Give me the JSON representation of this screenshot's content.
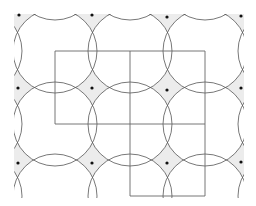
{
  "diagram": {
    "type": "circle-covering-lattice",
    "width": 256,
    "height": 206,
    "colors": {
      "background": "#ffffff",
      "uncovered_fill": "#ececec",
      "double_overlap_fill": "#dcdcdc",
      "quad_overlap_fill": "#b8b8b8",
      "stroke": "#555555",
      "grid_line": "#666666",
      "dot": "#111111"
    },
    "vertices_x": [
      55,
      130,
      205
    ],
    "vertices_y": [
      51,
      124,
      196
    ],
    "extra_circle_columns": [
      -20,
      280
    ],
    "extra_circle_rows": [
      -22
    ],
    "circle_radius": 42,
    "dots": [
      [
        19,
        15
      ],
      [
        92,
        15
      ],
      [
        167,
        17
      ],
      [
        241,
        16
      ],
      [
        18,
        88
      ],
      [
        92,
        88
      ],
      [
        167,
        90
      ],
      [
        241,
        88
      ],
      [
        18,
        163
      ],
      [
        92,
        163
      ],
      [
        167,
        163
      ],
      [
        241,
        162
      ]
    ],
    "dot_radius": 1.6,
    "grid_segments": [
      [
        55,
        51,
        205,
        51
      ],
      [
        55,
        124,
        205,
        124
      ],
      [
        130,
        196,
        205,
        196
      ],
      [
        55,
        51,
        55,
        124
      ],
      [
        130,
        51,
        130,
        196
      ],
      [
        205,
        51,
        205,
        196
      ]
    ],
    "clip": {
      "x": 14,
      "y": 14,
      "w": 230,
      "h": 184
    }
  }
}
